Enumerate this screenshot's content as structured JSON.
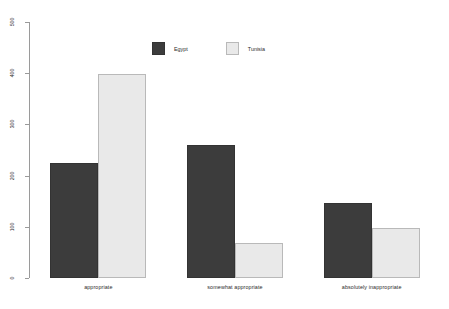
{
  "chart_data": {
    "type": "bar",
    "title": "",
    "subtitle": "",
    "xlabel": "",
    "ylabel": "",
    "grid": false,
    "legend_position": "top-center",
    "ylim": [
      0,
      500
    ],
    "yticks": [
      0,
      100,
      200,
      300,
      400,
      500
    ],
    "ytick_labels": [
      "0",
      "100",
      "200",
      "300",
      "400",
      "500"
    ],
    "categories": [
      "appropriate",
      "somewhat appropriate",
      "absolutely inappropriate"
    ],
    "series": [
      {
        "name": "Egypt",
        "color": "#3c3c3c",
        "values": [
          225,
          260,
          147
        ]
      },
      {
        "name": "Tunisia",
        "color": "#e9e9e9",
        "values": [
          399,
          69,
          98
        ]
      }
    ]
  },
  "axis": {
    "line_color": "#9a9a9a",
    "tick_color": "#9a9a9a",
    "label_color": "#2b2b2b"
  },
  "legend": {
    "items": [
      {
        "label": "Egypt",
        "swatch": "dark"
      },
      {
        "label": "Tunisia",
        "swatch": "light"
      }
    ]
  }
}
